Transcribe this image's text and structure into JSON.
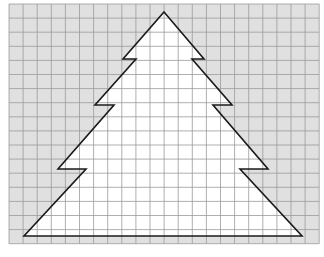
{
  "figure": {
    "grid": {
      "x0": 9,
      "y0": 4,
      "cell": 14.1,
      "cols": 22,
      "rows": 17,
      "shaded_color": "#e0e0e0",
      "line_color": "#9a9a9a"
    },
    "shape": {
      "name": "christmas-tree",
      "fill": "#ffffff",
      "stroke": "#1a1a1a",
      "points": [
        [
          164,
          12
        ],
        [
          204,
          59
        ],
        [
          192,
          59
        ],
        [
          232,
          105
        ],
        [
          213,
          105
        ],
        [
          268,
          169
        ],
        [
          240,
          169
        ],
        [
          302,
          236
        ],
        [
          24,
          236
        ],
        [
          86,
          169
        ],
        [
          58,
          169
        ],
        [
          114,
          105
        ],
        [
          95,
          105
        ],
        [
          136,
          59
        ],
        [
          123,
          59
        ]
      ]
    }
  }
}
